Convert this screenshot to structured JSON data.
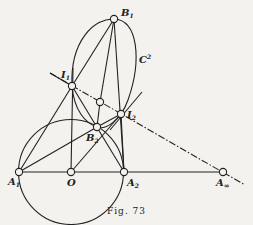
{
  "figure": {
    "caption": "Fig. 73",
    "colors": {
      "ink": "#222222",
      "paper": "#f4f2ee"
    },
    "points": {
      "B1": {
        "label": "B",
        "sub": "1",
        "x": 114,
        "y": 19
      },
      "I1": {
        "label": "I",
        "sub": "1",
        "x": 72,
        "y": 86
      },
      "I2": {
        "label": "I",
        "sub": "2",
        "x": 121,
        "y": 114
      },
      "B2": {
        "label": "B",
        "sub": "2",
        "x": 97,
        "y": 127
      },
      "P": {
        "label": "",
        "sub": "",
        "x": 100,
        "y": 102
      },
      "A1": {
        "label": "A",
        "sub": "1",
        "x": 19,
        "y": 172
      },
      "O": {
        "label": "O",
        "sub": "",
        "x": 71,
        "y": 172
      },
      "A2": {
        "label": "A",
        "sub": "2",
        "x": 124,
        "y": 172
      },
      "Ainf": {
        "label": "A",
        "sub": "∞",
        "x": 223,
        "y": 172
      }
    },
    "conic_label": {
      "label": "C",
      "sup": "2"
    }
  }
}
